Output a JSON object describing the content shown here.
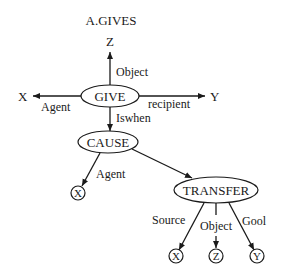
{
  "diagram": {
    "title": "A.GIVES",
    "nodes": {
      "give": "GIVE",
      "cause": "CAUSE",
      "transfer": "TRANSFER",
      "z_top": "Z",
      "x_left": "X",
      "y_right": "Y",
      "cause_x": "X",
      "transfer_x": "X",
      "transfer_z": "Z",
      "transfer_y": "Y"
    },
    "edges": {
      "give_object": "Object",
      "give_agent": "Agent",
      "give_recipient": "recipient",
      "give_iswhen": "Iswhen",
      "cause_agent": "Agent",
      "transfer_source": "Source",
      "transfer_object": "Object",
      "transfer_goal": "Gool"
    }
  }
}
